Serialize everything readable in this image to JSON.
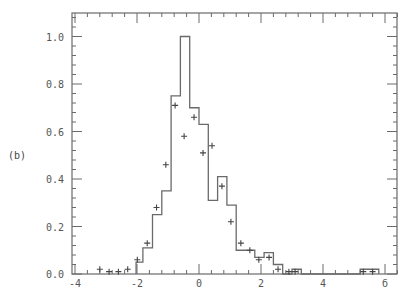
{
  "panel_label": "(b)",
  "chart_data": {
    "type": "bar",
    "title": "",
    "xlabel": "",
    "ylabel": "",
    "xlim": [
      -4,
      6.4
    ],
    "ylim": [
      0,
      1.1
    ],
    "grid": false,
    "legend": null,
    "x_ticks": [
      -4,
      -2,
      0,
      2,
      4,
      6
    ],
    "x_tick_labels": [
      "-4",
      "-2",
      "0",
      "2",
      "4",
      "б"
    ],
    "y_ticks": [
      0.0,
      0.2,
      0.4,
      0.6,
      0.8,
      1.0
    ],
    "y_tick_labels": [
      "0.0",
      "0.2",
      "0.4",
      "0.6",
      "0.8",
      "1.0"
    ],
    "series": [
      {
        "name": "histogram",
        "style": "step",
        "bins": [
          {
            "x0": -2.03,
            "x1": -1.81,
            "value": 0.05
          },
          {
            "x0": -1.81,
            "x1": -1.5,
            "value": 0.11
          },
          {
            "x0": -1.5,
            "x1": -1.2,
            "value": 0.25
          },
          {
            "x0": -1.2,
            "x1": -0.9,
            "value": 0.35
          },
          {
            "x0": -0.9,
            "x1": -0.6,
            "value": 0.75
          },
          {
            "x0": -0.6,
            "x1": -0.3,
            "value": 1.0
          },
          {
            "x0": -0.3,
            "x1": 0.0,
            "value": 0.7
          },
          {
            "x0": 0.0,
            "x1": 0.3,
            "value": 0.63
          },
          {
            "x0": 0.3,
            "x1": 0.6,
            "value": 0.31
          },
          {
            "x0": 0.6,
            "x1": 0.9,
            "value": 0.41
          },
          {
            "x0": 0.9,
            "x1": 1.2,
            "value": 0.29
          },
          {
            "x0": 1.2,
            "x1": 1.8,
            "value": 0.1
          },
          {
            "x0": 1.8,
            "x1": 2.1,
            "value": 0.07
          },
          {
            "x0": 2.1,
            "x1": 2.4,
            "value": 0.09
          },
          {
            "x0": 2.4,
            "x1": 2.7,
            "value": 0.04
          },
          {
            "x0": 2.7,
            "x1": 3.0,
            "value": 0.0
          },
          {
            "x0": 3.0,
            "x1": 3.3,
            "value": 0.02
          },
          {
            "x0": 3.3,
            "x1": 5.2,
            "value": 0.0
          },
          {
            "x0": 5.2,
            "x1": 5.8,
            "value": 0.02
          }
        ]
      },
      {
        "name": "points",
        "style": "plus-markers",
        "x": [
          -3.2,
          -2.9,
          -2.6,
          -2.3,
          -1.99,
          -1.67,
          -1.37,
          -1.07,
          -0.77,
          -0.48,
          -0.16,
          0.13,
          0.42,
          0.74,
          1.03,
          1.35,
          1.64,
          1.93,
          2.26,
          2.55,
          2.9,
          3.1,
          5.3,
          5.6
        ],
        "values": [
          0.02,
          0.01,
          0.01,
          0.02,
          0.06,
          0.13,
          0.28,
          0.46,
          0.71,
          0.58,
          0.66,
          0.51,
          0.54,
          0.37,
          0.22,
          0.13,
          0.1,
          0.06,
          0.07,
          0.02,
          0.01,
          0.01,
          0.01,
          0.01
        ]
      }
    ]
  }
}
